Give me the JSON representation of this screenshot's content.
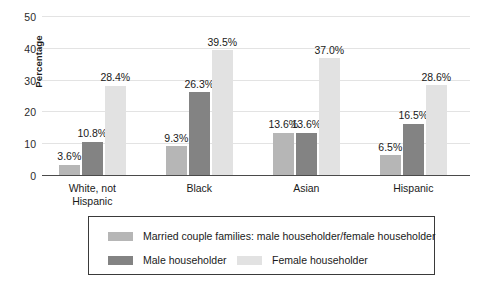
{
  "chart_data": {
    "type": "bar",
    "title": "",
    "subtitle": "",
    "xlabel": "",
    "ylabel": "Percentage",
    "ylim": [
      0,
      50
    ],
    "yticks": [
      0,
      10,
      20,
      30,
      40,
      50
    ],
    "ytick_labels": [
      "0",
      "10",
      "20",
      "30",
      "40",
      "50"
    ],
    "grid": true,
    "grid_axis": "y",
    "legend_position": "bottom",
    "value_label_suffix": "%",
    "categories": [
      "White, not\nHispanic",
      "Black",
      "Asian",
      "Hispanic"
    ],
    "category_labels_flat": [
      "White, not Hispanic",
      "Black",
      "Asian",
      "Hispanic"
    ],
    "series": [
      {
        "name": "Married couple families: male householder/female householder",
        "color": "#b6b6b6",
        "values": [
          3.6,
          10.8,
          13.6,
          6.5
        ],
        "data_labels": [
          "3.6%",
          "10.8%",
          "13.6%",
          "6.5%"
        ]
      },
      {
        "name": "Male householder",
        "color": "#838383",
        "values": [
          10.8,
          26.3,
          13.6,
          16.5
        ],
        "data_labels": [
          "10.8%",
          "26.3%",
          "13.6%",
          "16.5%"
        ]
      },
      {
        "name": "Female householder",
        "color": "#e2e2e2",
        "values": [
          28.4,
          39.5,
          37.0,
          28.6
        ],
        "data_labels": [
          "28.4%",
          "39.5%",
          "37.0%",
          "28.6%"
        ]
      }
    ],
    "points": [
      {
        "category": "White, not Hispanic",
        "married_couple": 3.6,
        "male_householder": 10.8,
        "female_householder": 28.4
      },
      {
        "category": "Black",
        "married_couple": 9.3,
        "male_householder": 26.3,
        "female_householder": 39.5
      },
      {
        "category": "Asian",
        "married_couple": 13.6,
        "male_householder": 13.6,
        "female_householder": 37.0
      },
      {
        "category": "Hispanic",
        "married_couple": 6.5,
        "male_householder": 16.5,
        "female_householder": 28.6
      }
    ]
  },
  "axis": {
    "y_title": "Percentage",
    "y_tick_0": "0",
    "y_tick_10": "10",
    "y_tick_20": "20",
    "y_tick_30": "30",
    "y_tick_40": "40",
    "y_tick_50": "50"
  },
  "groups": [
    {
      "label_line1": "White, not",
      "label_line2": "Hispanic",
      "bars": [
        {
          "value": 3.6,
          "label": "3.6%",
          "series": "married_couple"
        },
        {
          "value": 10.8,
          "label": "10.8%",
          "series": "male_householder"
        },
        {
          "value": 28.4,
          "label": "28.4%",
          "series": "female_householder"
        }
      ]
    },
    {
      "label_line1": "Black",
      "label_line2": "",
      "bars": [
        {
          "value": 9.3,
          "label": "9.3%",
          "series": "married_couple"
        },
        {
          "value": 26.3,
          "label": "26.3%",
          "series": "male_householder"
        },
        {
          "value": 39.5,
          "label": "39.5%",
          "series": "female_householder"
        }
      ]
    },
    {
      "label_line1": "Asian",
      "label_line2": "",
      "bars": [
        {
          "value": 13.6,
          "label": "13.6%",
          "series": "married_couple"
        },
        {
          "value": 13.6,
          "label": "13.6%",
          "series": "male_householder"
        },
        {
          "value": 37.0,
          "label": "37.0%",
          "series": "female_householder"
        }
      ]
    },
    {
      "label_line1": "Hispanic",
      "label_line2": "",
      "bars": [
        {
          "value": 6.5,
          "label": "6.5%",
          "series": "married_couple"
        },
        {
          "value": 16.5,
          "label": "16.5%",
          "series": "male_householder"
        },
        {
          "value": 28.6,
          "label": "28.6%",
          "series": "female_householder"
        }
      ]
    }
  ],
  "legend": {
    "row1": [
      {
        "label": "Married couple families: male householder/female householder",
        "color": "#b6b6b6"
      }
    ],
    "row2": [
      {
        "label": "Male householder",
        "color": "#838383"
      },
      {
        "label": "Female householder",
        "color": "#e2e2e2"
      }
    ]
  },
  "colors": {
    "series_married_couple": "#b6b6b6",
    "series_male_householder": "#838383",
    "series_female_householder": "#e2e2e2",
    "gridline": "#e3e3e3",
    "axis": "#4a4a4a",
    "text": "#1a1a1a",
    "background": "#ffffff",
    "legend_border": "#3a3a3a"
  }
}
